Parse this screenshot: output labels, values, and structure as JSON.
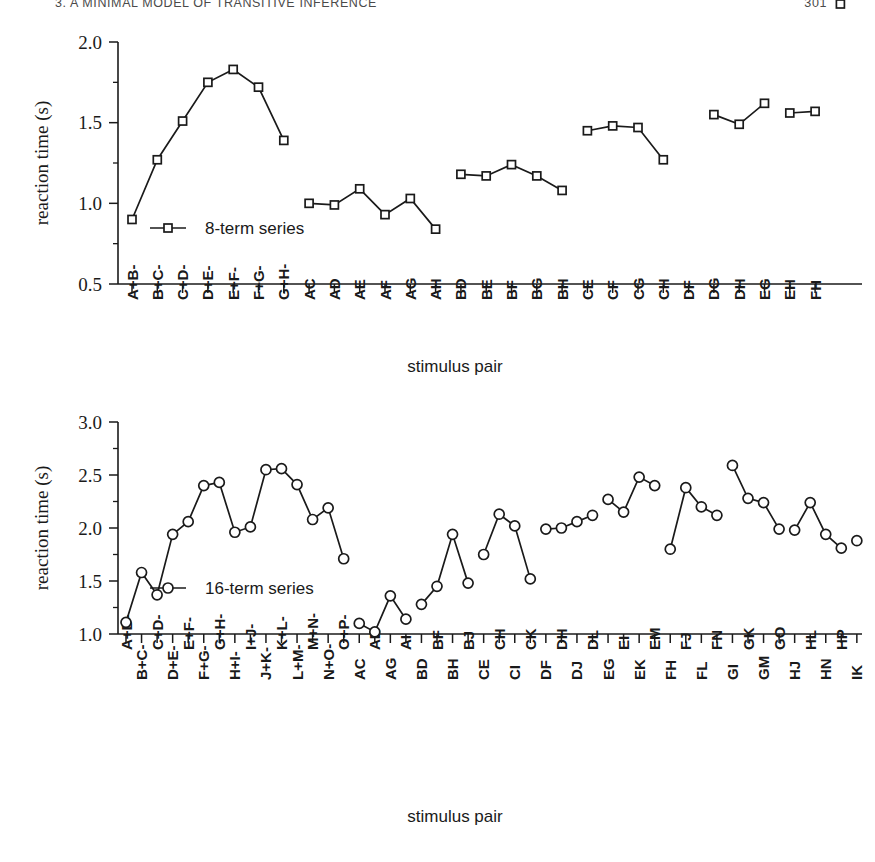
{
  "page": {
    "running_head": "3. A MINIMAL MODEL OF TRANSITIVE INFERENCE",
    "folio": "301"
  },
  "figure": {
    "xaxis_title_top": "stimulus pair",
    "xaxis_title_bottom": "stimulus pair",
    "ylabel": "reaction time (s)"
  },
  "chart_data": [
    {
      "type": "line",
      "title": "",
      "xlabel": "stimulus pair",
      "ylabel": "reaction time (s)",
      "ylim": [
        0.5,
        2.0
      ],
      "yticks": [
        "0.5",
        "1.0",
        "1.5",
        "2.0"
      ],
      "ytick_values": [
        0.5,
        1.0,
        1.5,
        2.0
      ],
      "minor_ticks": true,
      "grid": false,
      "legend": "8-term series",
      "legend_marker": "open-square",
      "legend_position": "inside-left",
      "categories": [
        "A+B-",
        "B+C-",
        "C+D-",
        "D+E-",
        "E+F-",
        "F+G-",
        "G+H-",
        "AC",
        "AD",
        "AE",
        "AF",
        "AG",
        "AH",
        "BD",
        "BE",
        "BF",
        "BG",
        "BH",
        "CE",
        "CF",
        "CG",
        "CH",
        "DF",
        "DG",
        "DH",
        "EG",
        "EH",
        "FH"
      ],
      "values": [
        0.9,
        1.27,
        1.51,
        1.75,
        1.83,
        1.72,
        1.39,
        1.0,
        0.99,
        1.09,
        0.93,
        1.03,
        0.84,
        1.18,
        1.17,
        1.24,
        1.17,
        1.08,
        1.45,
        1.48,
        1.47,
        1.27,
        1.59,
        1.55,
        1.49,
        1.62,
        1.56,
        1.57
      ],
      "segments": [
        {
          "name": "adjacent",
          "start": 0,
          "count": 7
        },
        {
          "name": "A-pairs",
          "start": 7,
          "count": 6
        },
        {
          "name": "B-pairs",
          "start": 13,
          "count": 5
        },
        {
          "name": "C-pairs",
          "start": 18,
          "count": 4
        },
        {
          "name": "D-pairs",
          "start": 23,
          "count": 3
        },
        {
          "name": "E-pairs",
          "start": 26,
          "count": 2
        },
        {
          "name": "F-pairs",
          "start": 28,
          "count": 1
        }
      ],
      "label_stagger": false
    },
    {
      "type": "line",
      "title": "",
      "xlabel": "stimulus pair",
      "ylabel": "reaction time (s)",
      "ylim": [
        1.0,
        3.0
      ],
      "yticks": [
        "1.0",
        "1.5",
        "2.0",
        "2.5",
        "3.0"
      ],
      "ytick_values": [
        1.0,
        1.5,
        2.0,
        2.5,
        3.0
      ],
      "minor_ticks": true,
      "grid": false,
      "legend": "16-term series",
      "legend_marker": "open-circle",
      "legend_position": "inside-left",
      "categories": [
        "A+B-",
        "B+C-",
        "C+D-",
        "D+E-",
        "E+F-",
        "F+G-",
        "G+H-",
        "H+I-",
        "I+J-",
        "J+K-",
        "K+L-",
        "L+M-",
        "M+N-",
        "N+O-",
        "O+P-",
        "AC",
        "AE",
        "AG",
        "AI",
        "BD",
        "BF",
        "BH",
        "BJ",
        "CE",
        "CH",
        "CI",
        "CK",
        "DF",
        "DH",
        "DJ",
        "DL",
        "EG",
        "EI",
        "EK",
        "EM",
        "FH",
        "FJ",
        "FL",
        "FN",
        "GI",
        "GK",
        "GM",
        "GO",
        "HJ",
        "HL",
        "HN",
        "HP",
        "IK"
      ],
      "values": [
        1.11,
        1.58,
        1.37,
        1.94,
        2.06,
        2.4,
        2.43,
        1.96,
        2.01,
        2.55,
        2.56,
        2.41,
        2.08,
        2.19,
        1.71,
        1.1,
        1.02,
        1.36,
        1.14,
        1.28,
        1.45,
        1.94,
        1.48,
        1.75,
        2.13,
        2.02,
        1.52,
        1.99,
        2.0,
        2.06,
        2.12,
        2.27,
        2.15,
        2.48,
        2.4,
        1.8,
        2.38,
        2.2,
        2.12,
        2.59,
        2.28,
        2.24,
        1.99,
        1.98,
        2.24,
        1.94,
        1.81,
        1.88
      ],
      "segments": [
        {
          "name": "adjacent",
          "start": 0,
          "count": 15
        },
        {
          "name": "A-pairs",
          "start": 15,
          "count": 4
        },
        {
          "name": "B-pairs",
          "start": 19,
          "count": 4
        },
        {
          "name": "C-pairs",
          "start": 23,
          "count": 4
        },
        {
          "name": "D-pairs",
          "start": 27,
          "count": 4
        },
        {
          "name": "E-pairs",
          "start": 31,
          "count": 4
        },
        {
          "name": "F-pairs",
          "start": 35,
          "count": 4
        },
        {
          "name": "G-pairs",
          "start": 39,
          "count": 4
        },
        {
          "name": "H-pairs",
          "start": 43,
          "count": 4
        },
        {
          "name": "I-pairs",
          "start": 47,
          "count": 1
        }
      ],
      "label_stagger": true
    }
  ]
}
